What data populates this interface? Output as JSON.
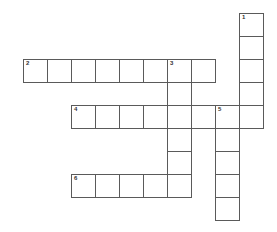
{
  "puzzle": {
    "type": "crossword",
    "cell_pitch_x": 24,
    "cell_pitch_y": 23,
    "origin_x": 23,
    "origin_y": 13,
    "border_color": "#5a5a5a",
    "words": [
      {
        "number": "1",
        "direction": "down",
        "col": 9,
        "row": 0,
        "length": 5
      },
      {
        "number": "2",
        "direction": "across",
        "col": 0,
        "row": 2,
        "length": 8
      },
      {
        "number": "3",
        "direction": "down",
        "col": 6,
        "row": 2,
        "length": 6
      },
      {
        "number": "4",
        "direction": "across",
        "col": 2,
        "row": 4,
        "length": 8
      },
      {
        "number": "5",
        "direction": "down",
        "col": 8,
        "row": 4,
        "length": 5
      },
      {
        "number": "6",
        "direction": "across",
        "col": 2,
        "row": 7,
        "length": 5
      }
    ]
  }
}
